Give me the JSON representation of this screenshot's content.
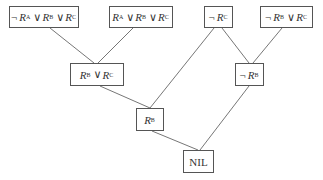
{
  "diagram": {
    "type": "resolution-tree",
    "nodes": [
      {
        "id": "n1",
        "label": "¬R_A ∨R_B ∨R_C",
        "terms": [
          {
            "neg": true,
            "var": "R",
            "sub": "A"
          },
          {
            "neg": false,
            "var": "R",
            "sub": "B"
          },
          {
            "neg": false,
            "var": "R",
            "sub": "C"
          }
        ],
        "box": [
          9,
          6,
          70,
          22
        ]
      },
      {
        "id": "n2",
        "label": "R_A ∨R_B ∨R_C",
        "terms": [
          {
            "neg": false,
            "var": "R",
            "sub": "A"
          },
          {
            "neg": false,
            "var": "R",
            "sub": "B"
          },
          {
            "neg": false,
            "var": "R",
            "sub": "C"
          }
        ],
        "box": [
          109,
          6,
          64,
          22
        ]
      },
      {
        "id": "n3",
        "label": "¬R_C",
        "terms": [
          {
            "neg": true,
            "var": "R",
            "sub": "C"
          }
        ],
        "box": [
          204,
          6,
          29,
          22
        ]
      },
      {
        "id": "n4",
        "label": "¬R_B ∨R_C",
        "terms": [
          {
            "neg": true,
            "var": "R",
            "sub": "B"
          },
          {
            "neg": false,
            "var": "R",
            "sub": "C"
          }
        ],
        "box": [
          260,
          6,
          53,
          22
        ]
      },
      {
        "id": "n5",
        "label": "R_B ∨R_C",
        "terms": [
          {
            "neg": false,
            "var": "R",
            "sub": "B"
          },
          {
            "neg": false,
            "var": "R",
            "sub": "C"
          }
        ],
        "box": [
          70,
          63,
          54,
          23
        ]
      },
      {
        "id": "n6",
        "label": "¬R_B",
        "terms": [
          {
            "neg": true,
            "var": "R",
            "sub": "B"
          }
        ],
        "box": [
          235,
          63,
          29,
          23
        ]
      },
      {
        "id": "n7",
        "label": "R_B",
        "terms": [
          {
            "neg": false,
            "var": "R",
            "sub": "B"
          }
        ],
        "box": [
          136,
          108,
          28,
          23
        ]
      },
      {
        "id": "n8",
        "label": "NIL",
        "terms": [],
        "text": "NIL",
        "box": [
          183,
          150,
          31,
          23
        ]
      }
    ],
    "edges": [
      {
        "from": "n1",
        "to": "n5"
      },
      {
        "from": "n2",
        "to": "n5"
      },
      {
        "from": "n3",
        "to": "n7"
      },
      {
        "from": "n3",
        "to": "n6"
      },
      {
        "from": "n4",
        "to": "n6"
      },
      {
        "from": "n5",
        "to": "n7"
      },
      {
        "from": "n7",
        "to": "n8"
      },
      {
        "from": "n6",
        "to": "n8"
      }
    ],
    "symbols": {
      "not": "¬",
      "or": "∨",
      "var": "R"
    },
    "colors": {
      "stroke": "#555555",
      "text": "#333333",
      "background": "#ffffff"
    }
  }
}
